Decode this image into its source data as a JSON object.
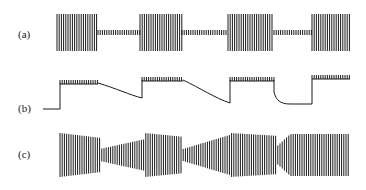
{
  "figure": {
    "panels": [
      {
        "id": "a",
        "label": "(a)",
        "description": "Amplitude-modulated burst signal: high-amplitude bursts alternating with low-amplitude segments"
      },
      {
        "id": "b",
        "label": "(b)",
        "description": "Envelope/level trace: step up, flat segments with decays during low segments"
      },
      {
        "id": "c",
        "label": "(c)",
        "description": "Burst signal with gradual amplitude transitions between segments"
      }
    ],
    "colors": {
      "ink": "#1a1a1a",
      "background": "#ffffff"
    }
  }
}
